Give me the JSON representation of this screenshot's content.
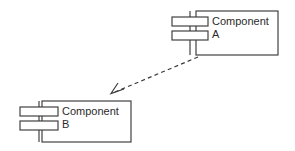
{
  "diagram": {
    "kind": "uml-component-diagram",
    "title": "",
    "background_color": "#ffffff",
    "line_color": "#3a3a3a",
    "fill_color": "#ffffff",
    "text_color": "#2b2b2b",
    "components": [
      {
        "id": "component-a",
        "name_line1": "Component",
        "name_line2": "A",
        "body": {
          "x": 196,
          "y": 11,
          "width": 82,
          "height": 44
        },
        "label": {
          "x": 212,
          "y": 25,
          "line_height": 13
        },
        "tabs": [
          {
            "x": 172,
            "y": 17,
            "width": 36,
            "height": 9
          },
          {
            "x": 172,
            "y": 31,
            "width": 36,
            "height": 9
          }
        ],
        "tab_connector": {
          "x": 190,
          "y1": 11,
          "y2": 55
        }
      },
      {
        "id": "component-b",
        "name_line1": "Component",
        "name_line2": "B",
        "body": {
          "x": 42,
          "y": 101,
          "width": 89,
          "height": 41
        },
        "label": {
          "x": 62,
          "y": 115,
          "line_height": 13
        },
        "tabs": [
          {
            "x": 20,
            "y": 107,
            "width": 38,
            "height": 9
          },
          {
            "x": 20,
            "y": 121,
            "width": 38,
            "height": 9
          }
        ],
        "tab_connector": {
          "x": 39,
          "y1": 101,
          "y2": 142
        }
      }
    ],
    "relationships": [
      {
        "id": "dependency-a-to-b",
        "type": "dependency",
        "stereotype": "",
        "line_style": "dashed",
        "arrowhead": "open",
        "from": "component-a",
        "to": "component-b",
        "start": {
          "x": 198,
          "y": 57
        },
        "end": {
          "x": 112,
          "y": 93
        },
        "arrowhead_points": "124,89 111,93.5 118,83"
      }
    ]
  }
}
